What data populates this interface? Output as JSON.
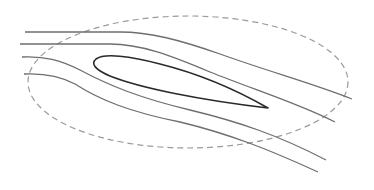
{
  "diagram": {
    "title": "",
    "colors": {
      "background": "#ffffff",
      "streamline": "#6e6e6e",
      "airfoil": "#2a2a2a",
      "boundary": "#9a9a9a"
    },
    "elements": {
      "boundary": {
        "shape": "ellipse",
        "style": "dashed",
        "cx": 188,
        "cy": 82,
        "rx": 160,
        "ry": 66
      },
      "airfoil": {
        "leading_edge": [
          96,
          60
        ],
        "trailing_edge": [
          268,
          108
        ]
      },
      "streamlines": [
        {
          "id": 1,
          "start": [
            25,
            32
          ],
          "end": [
            352,
            99
          ]
        },
        {
          "id": 2,
          "start": [
            20,
            44
          ],
          "end": [
            335,
            122
          ]
        },
        {
          "id": 3,
          "start": [
            22,
            57
          ],
          "end": [
            326,
            160
          ]
        },
        {
          "id": 4,
          "start": [
            24,
            74
          ],
          "end": [
            318,
            172
          ]
        }
      ]
    }
  }
}
